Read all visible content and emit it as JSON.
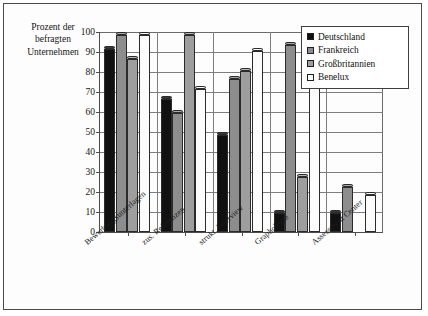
{
  "chart_data": {
    "type": "bar",
    "title": "",
    "ylabel": "Prozent der befragten Unternehmen",
    "xlabel": "",
    "ylim": [
      0,
      100
    ],
    "yticks": [
      0,
      10,
      20,
      30,
      40,
      50,
      60,
      70,
      80,
      90,
      100
    ],
    "grid": true,
    "legend_position": "top-right",
    "categories": [
      "Bewerbungsunterlagen",
      "zus. Referenzen",
      "strukt. Interview",
      "Graphologie",
      "Assessment Center"
    ],
    "series": [
      {
        "name": "Deutschland",
        "color": "#111111",
        "values": [
          93,
          68,
          50,
          11,
          11
        ]
      },
      {
        "name": "Frankreich",
        "color": "#8d8d8d",
        "values": [
          100,
          61,
          78,
          95,
          24
        ]
      },
      {
        "name": "Großbritannien",
        "color": "#9e9e9e",
        "values": [
          88,
          100,
          82,
          29,
          0
        ]
      },
      {
        "name": "Benelux",
        "color": "#fcfcfc",
        "values": [
          100,
          73,
          92,
          74,
          20
        ]
      }
    ]
  },
  "axis_title": {
    "line1": "Prozent der",
    "line2": "befragten",
    "line3": "Unternehmen"
  }
}
